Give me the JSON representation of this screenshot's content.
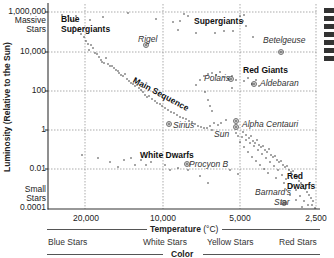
{
  "chart_data": {
    "type": "scatter",
    "xlabel": "Temperature (°C)",
    "ylabel": "Luminosity (Relative to the Sun)",
    "x_scale": "log, reversed (hot on left)",
    "y_scale": "log",
    "x_ticks": [
      "20,000",
      "10,000",
      "5,000",
      "2,500"
    ],
    "x_tick_values": [
      20000,
      10000,
      5000,
      2500
    ],
    "y_ticks": [
      "1,000,000",
      "10,000",
      "100",
      "1",
      "0.01",
      "0.0001"
    ],
    "y_tick_values": [
      1000000,
      10000,
      100,
      1,
      0.01,
      0.0001
    ],
    "y_extremes": {
      "top": "Massive Stars",
      "bottom": "Small Stars"
    },
    "xlim": [
      28000,
      2400
    ],
    "ylim": [
      0.0001,
      3000000
    ],
    "grid": "dotted, at every tick",
    "color_band": {
      "title": "Color",
      "labels": [
        "Blue Stars",
        "White Stars",
        "Yellow Stars",
        "Red Stars"
      ]
    },
    "regions": [
      {
        "name": "Blue Supergiants",
        "x": 26000,
        "y": 300000
      },
      {
        "name": "Supergiants",
        "x": 7000,
        "y": 500000
      },
      {
        "name": "Main Sequence",
        "x": 12000,
        "y": 10,
        "note": "rotated along diagonal band"
      },
      {
        "name": "Red Giants",
        "x": 4500,
        "y": 200
      },
      {
        "name": "White Dwarfs",
        "x": 13000,
        "y": 0.02
      },
      {
        "name": "Red Dwarfs",
        "x": 3000,
        "y": 0.004
      }
    ],
    "named_stars": [
      {
        "name": "Rigel",
        "x": 12500,
        "y": 30000
      },
      {
        "name": "Betelgeuse",
        "x": 3300,
        "y": 10000
      },
      {
        "name": "Polaris",
        "x": 6000,
        "y": 300
      },
      {
        "name": "Aldebaran",
        "x": 4300,
        "y": 100
      },
      {
        "name": "Sirius",
        "x": 9800,
        "y": 3
      },
      {
        "name": "Alpha Centauri",
        "x": 5200,
        "y": 2
      },
      {
        "name": "Sun",
        "x": 5200,
        "y": 1
      },
      {
        "name": "Procyon B",
        "x": 8000,
        "y": 0.02
      },
      {
        "name": "Barnard's Star",
        "x": 2850,
        "y": 0.0003
      }
    ]
  },
  "labels": {
    "y_axis_title": "Luminosity (Relative to the Sun)",
    "massive_line1": "Massive",
    "massive_line2": "Stars",
    "small_line1": "Small",
    "small_line2": "Stars",
    "y_ticks": [
      "1,000,000",
      "10,000",
      "100",
      "1",
      "0.01",
      "0.0001"
    ],
    "x_ticks": [
      "20,000",
      "10,000",
      "5,000",
      "2,500"
    ],
    "x_axis_title": "Temperature",
    "x_axis_unit": "(°C)",
    "color_title": "Color",
    "colors": [
      "Blue Stars",
      "White Stars",
      "Yellow Stars",
      "Red Stars"
    ],
    "regions": {
      "blue_supergiants_1": "Blue",
      "blue_supergiants_2": "Supergiants",
      "supergiants": "Supergiants",
      "main_sequence": "Main Sequence",
      "red_giants": "Red Giants",
      "white_dwarfs": "White Dwarfs",
      "red_dwarfs_1": "Red",
      "red_dwarfs_2": "Dwarfs"
    },
    "stars": {
      "rigel": "Rigel",
      "betelgeuse": "Betelgeuse",
      "polaris": "Polaris",
      "aldebaran": "Aldebaran",
      "sirius": "Sirius",
      "alpha_centauri": "Alpha Centauri",
      "sun": "Sun",
      "procyon_b": "Procyon B",
      "barnards_1": "Barnard's",
      "barnards_2": "Star"
    }
  },
  "colors": {
    "ink": "#222222",
    "grid": "#888888",
    "background": "#ffffff"
  }
}
